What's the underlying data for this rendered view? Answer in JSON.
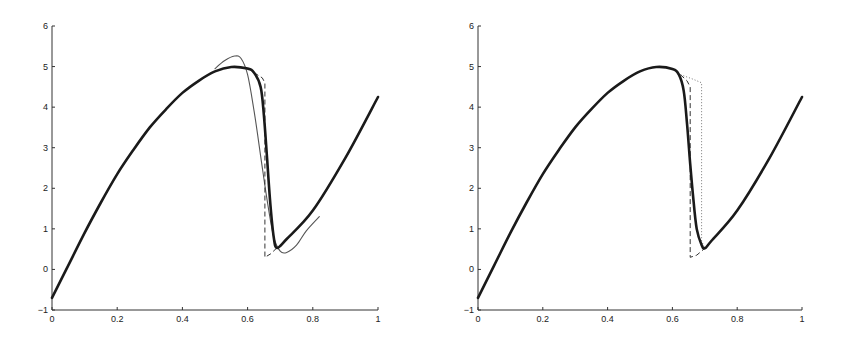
{
  "chart_data": [
    {
      "type": "line",
      "title": "",
      "xlabel": "",
      "ylabel": "",
      "xlim": [
        0,
        1
      ],
      "ylim": [
        -1,
        6
      ],
      "xticks": [
        "0",
        "0.2",
        "0.4",
        "0.6",
        "0.8",
        "1"
      ],
      "yticks": [
        "-1",
        "0",
        "1",
        "2",
        "3",
        "4",
        "5",
        "6"
      ],
      "grid": false,
      "legend": null,
      "series": [
        {
          "name": "thick-solid",
          "style": "solid-thick",
          "color": "#1a1a1a",
          "x": [
            0,
            0.05,
            0.1,
            0.15,
            0.2,
            0.25,
            0.3,
            0.35,
            0.4,
            0.45,
            0.5,
            0.55,
            0.6,
            0.62,
            0.64,
            0.65,
            0.66,
            0.67,
            0.68,
            0.69,
            0.72,
            0.8,
            0.9,
            1.0
          ],
          "y": [
            -0.7,
            0.1,
            0.9,
            1.65,
            2.35,
            2.95,
            3.5,
            3.95,
            4.35,
            4.65,
            4.88,
            4.99,
            4.95,
            4.85,
            4.5,
            3.8,
            2.7,
            1.6,
            0.8,
            0.53,
            0.75,
            1.45,
            2.75,
            4.25
          ]
        },
        {
          "name": "thin-solid-oscillating",
          "style": "solid-thin",
          "color": "#555555",
          "x": [
            0.5,
            0.53,
            0.56,
            0.58,
            0.6,
            0.62,
            0.64,
            0.66,
            0.68,
            0.7,
            0.72,
            0.75,
            0.78,
            0.82
          ],
          "y": [
            4.95,
            5.15,
            5.26,
            5.2,
            4.8,
            3.9,
            2.8,
            1.7,
            0.8,
            0.45,
            0.42,
            0.6,
            0.95,
            1.3
          ]
        },
        {
          "name": "dashed-exact",
          "style": "dashed",
          "color": "#333333",
          "x": [
            0.62,
            0.645,
            0.653,
            0.653,
            0.67,
            0.69
          ],
          "y": [
            4.85,
            4.72,
            4.6,
            0.3,
            0.38,
            0.53
          ]
        }
      ]
    },
    {
      "type": "line",
      "title": "",
      "xlabel": "",
      "ylabel": "",
      "xlim": [
        0,
        1
      ],
      "ylim": [
        -1,
        6
      ],
      "xticks": [
        "0",
        "0.2",
        "0.4",
        "0.6",
        "0.8",
        "1"
      ],
      "yticks": [
        "-1",
        "0",
        "1",
        "2",
        "3",
        "4",
        "5",
        "6"
      ],
      "grid": false,
      "legend": null,
      "series": [
        {
          "name": "thick-solid",
          "style": "solid-thick",
          "color": "#1a1a1a",
          "x": [
            0,
            0.05,
            0.1,
            0.15,
            0.2,
            0.25,
            0.3,
            0.35,
            0.4,
            0.45,
            0.5,
            0.55,
            0.6,
            0.62,
            0.635,
            0.645,
            0.655,
            0.665,
            0.675,
            0.69,
            0.7,
            0.72,
            0.8,
            0.9,
            1.0
          ],
          "y": [
            -0.7,
            0.1,
            0.9,
            1.65,
            2.35,
            2.95,
            3.5,
            3.95,
            4.35,
            4.65,
            4.88,
            4.99,
            4.94,
            4.8,
            4.4,
            3.6,
            2.6,
            1.7,
            1.0,
            0.6,
            0.52,
            0.7,
            1.45,
            2.75,
            4.25
          ]
        },
        {
          "name": "dashed",
          "style": "dashed",
          "color": "#333333",
          "x": [
            0.625,
            0.645,
            0.655,
            0.655,
            0.675,
            0.7
          ],
          "y": [
            4.8,
            4.65,
            4.5,
            0.3,
            0.35,
            0.52
          ]
        },
        {
          "name": "dotted",
          "style": "dotted",
          "color": "#777777",
          "x": [
            0.625,
            0.66,
            0.69,
            0.69,
            0.7
          ],
          "y": [
            4.8,
            4.7,
            4.6,
            0.7,
            0.52
          ]
        }
      ]
    }
  ]
}
